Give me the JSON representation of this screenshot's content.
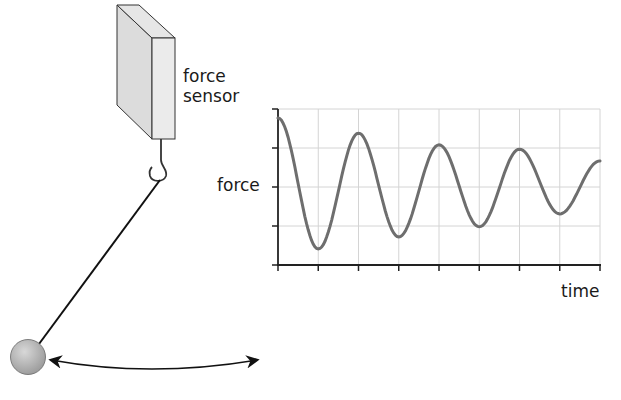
{
  "figure": {
    "sensor_label_line1": "force",
    "sensor_label_line2": "sensor",
    "components": [
      "force sensor",
      "hook",
      "string",
      "pendulum bob",
      "swing arrow"
    ]
  },
  "colors": {
    "curve": "#6e6e6e",
    "grid": "#d4d4d4",
    "axis": "#222222",
    "sensor_front": "#ebebeb",
    "sensor_side": "#dcdcdc",
    "sensor_top": "#e6e6e6",
    "ball": "#b9b9b9"
  },
  "chart_data": {
    "type": "line",
    "title": "",
    "xlabel": "time",
    "ylabel": "force",
    "x_ticks": 9,
    "y_ticks": 5,
    "tick_labels": false,
    "grid": true,
    "series": [
      {
        "name": "force",
        "x": [
          0,
          1,
          2,
          3,
          4,
          5,
          6,
          7,
          8
        ],
        "y": [
          3.77,
          0.41,
          3.38,
          0.72,
          3.08,
          0.98,
          2.97,
          1.31,
          2.67
        ]
      }
    ],
    "xlim": [
      0,
      8
    ],
    "ylim": [
      0,
      4
    ]
  }
}
